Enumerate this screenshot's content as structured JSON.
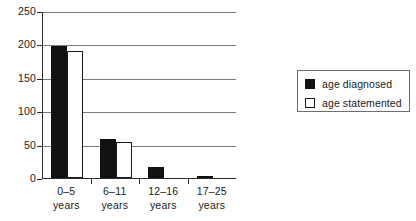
{
  "chart_data": {
    "type": "bar",
    "title": "",
    "xlabel": "",
    "ylabel": "",
    "categories": [
      "0–5\nyears",
      "6–11\nyears",
      "12–16\nyears",
      "17–25\nyears"
    ],
    "category_lines": [
      {
        "line1": "0–5",
        "line2": "years"
      },
      {
        "line1": "6–11",
        "line2": "years"
      },
      {
        "line1": "12–16",
        "line2": "years"
      },
      {
        "line1": "17–25",
        "line2": "years"
      }
    ],
    "series": [
      {
        "name": "age diagnosed",
        "color": "#111111",
        "style": "filled",
        "values": [
          198,
          58,
          16,
          3
        ]
      },
      {
        "name": "age statemented",
        "color": "#ffffff",
        "style": "hollow",
        "values": [
          190,
          54,
          0,
          0
        ]
      }
    ],
    "ylim": [
      0,
      250
    ],
    "yticks": [
      0,
      50,
      100,
      150,
      200,
      250
    ],
    "ytick_labels": [
      "0",
      "50",
      "100",
      "150",
      "200",
      "250"
    ],
    "grid": true,
    "grid_axis": "y",
    "legend_position": "right"
  },
  "legend": {
    "items": [
      {
        "label": "age diagnosed",
        "style": "filled"
      },
      {
        "label": "age statemented",
        "style": "hollow"
      }
    ]
  }
}
